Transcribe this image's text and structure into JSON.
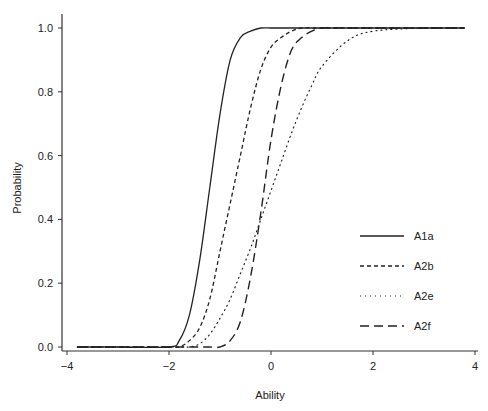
{
  "chart_data": {
    "type": "line",
    "title": "",
    "xlabel": "Ability",
    "ylabel": "Probability",
    "xlim": [
      -4,
      4
    ],
    "ylim": [
      0,
      1
    ],
    "xticks": [
      -4,
      -2,
      0,
      2,
      4
    ],
    "xtick_labels": [
      "-4",
      "-2",
      "0",
      "2",
      "4"
    ],
    "yticks": [
      0.0,
      0.2,
      0.4,
      0.6,
      0.8,
      1.0
    ],
    "ytick_labels": [
      "0.0",
      "0.2",
      "0.4",
      "0.6",
      "0.8",
      "1.0"
    ],
    "grid": false,
    "legend_position": "right-center",
    "x": [
      -3.8,
      -3.0,
      -2.0,
      -1.8,
      -1.6,
      -1.4,
      -1.2,
      -1.0,
      -0.8,
      -0.6,
      -0.4,
      -0.2,
      0.0,
      0.2,
      0.4,
      0.6,
      0.8,
      1.0,
      1.5,
      2.0,
      3.0,
      3.8
    ],
    "series": [
      {
        "name": "A1a",
        "style": "solid",
        "values": [
          0.0,
          0.0,
          0.0,
          0.02,
          0.1,
          0.27,
          0.5,
          0.73,
          0.9,
          0.97,
          0.99,
          1.0,
          1.0,
          1.0,
          1.0,
          1.0,
          1.0,
          1.0,
          1.0,
          1.0,
          1.0,
          1.0
        ]
      },
      {
        "name": "A2b",
        "style": "short-dash",
        "values": [
          0.0,
          0.0,
          0.0,
          0.0,
          0.02,
          0.06,
          0.15,
          0.3,
          0.45,
          0.6,
          0.75,
          0.87,
          0.94,
          0.97,
          0.99,
          1.0,
          1.0,
          1.0,
          1.0,
          1.0,
          1.0,
          1.0
        ]
      },
      {
        "name": "A2e",
        "style": "dotted",
        "values": [
          0.0,
          0.0,
          0.0,
          0.0,
          0.0,
          0.01,
          0.04,
          0.09,
          0.15,
          0.23,
          0.31,
          0.4,
          0.49,
          0.58,
          0.67,
          0.75,
          0.82,
          0.88,
          0.96,
          0.99,
          1.0,
          1.0
        ]
      },
      {
        "name": "A2f",
        "style": "long-dash",
        "values": [
          0.0,
          0.0,
          0.0,
          0.0,
          0.0,
          0.0,
          0.0,
          0.0,
          0.02,
          0.08,
          0.22,
          0.42,
          0.65,
          0.82,
          0.93,
          0.97,
          0.99,
          1.0,
          1.0,
          1.0,
          1.0,
          1.0
        ]
      }
    ]
  },
  "legend": {
    "items": [
      {
        "label": "A1a",
        "style": "solid"
      },
      {
        "label": "A2b",
        "style": "short-dash"
      },
      {
        "label": "A2e",
        "style": "dotted"
      },
      {
        "label": "A2f",
        "style": "long-dash"
      }
    ]
  },
  "colors": {
    "line": "#222222",
    "axis": "#333333",
    "background": "#ffffff"
  }
}
